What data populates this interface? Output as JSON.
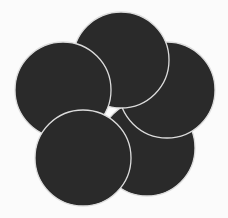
{
  "figure": {
    "title": "",
    "width": 228,
    "height": 218,
    "background": "#fbfbfb",
    "fill_color": "#2a2a2a",
    "stroke_color": "#dcdcdc",
    "stroke_width": 1.3,
    "circles": [
      {
        "id": "bottom-right",
        "cx": 147,
        "cy": 148,
        "r": 48,
        "z": 1
      },
      {
        "id": "right",
        "cx": 167,
        "cy": 90,
        "r": 48,
        "z": 2
      },
      {
        "id": "top",
        "cx": 121,
        "cy": 60,
        "r": 48,
        "z": 3
      },
      {
        "id": "left",
        "cx": 63,
        "cy": 90,
        "r": 48,
        "z": 4
      },
      {
        "id": "bottom-left",
        "cx": 83,
        "cy": 158,
        "r": 48,
        "z": 5
      }
    ]
  }
}
